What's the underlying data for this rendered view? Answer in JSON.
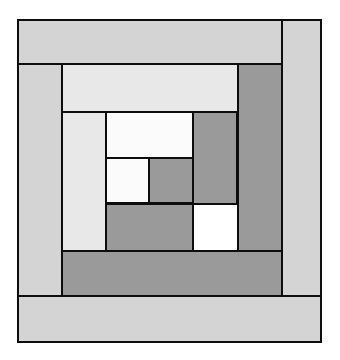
{
  "figure": {
    "type": "quilt-block-diagram",
    "width": 340,
    "height": 360,
    "background": "#ffffff"
  },
  "palette": {
    "outline": "#0d0d0d",
    "outline_width": 2,
    "light_outer": "#d4d4d4",
    "light_inner": "#e8e8e8",
    "light_center": "#fbfbfb",
    "dark": "#9a9a9a",
    "background": "#ffffff"
  },
  "block": {
    "name": "log-cabin-block",
    "bounds": {
      "x": 17,
      "y": 19,
      "width": 305,
      "height": 324
    },
    "center_label": "",
    "ring_count": 3,
    "rotation": "clockwise-spiral"
  },
  "patches": [
    {
      "id": "outer-strip-top",
      "label": "Outer top light log",
      "ring": 1,
      "side": "top",
      "value": "light",
      "color": "#d4d4d4",
      "x": 17,
      "y": 19,
      "width": 266,
      "height": 46
    },
    {
      "id": "outer-strip-right",
      "label": "Outer right light log",
      "ring": 1,
      "side": "right",
      "value": "light",
      "color": "#d4d4d4",
      "x": 281,
      "y": 19,
      "width": 41,
      "height": 324
    },
    {
      "id": "outer-strip-left",
      "label": "Outer left light log",
      "ring": 1,
      "side": "left",
      "value": "light",
      "color": "#d4d4d4",
      "x": 17,
      "y": 63,
      "width": 46,
      "height": 234
    },
    {
      "id": "outer-strip-bottom",
      "label": "Outer bottom light log",
      "ring": 1,
      "side": "bottom",
      "value": "light",
      "color": "#d4d4d4",
      "x": 17,
      "y": 295,
      "width": 305,
      "height": 48
    },
    {
      "id": "ring2-strip-top",
      "label": "Ring 2 top light log",
      "ring": 2,
      "side": "top",
      "value": "light",
      "color": "#e8e8e8",
      "x": 61,
      "y": 63,
      "width": 178,
      "height": 50
    },
    {
      "id": "ring2-strip-right",
      "label": "Ring 2 right dark log",
      "ring": 2,
      "side": "right",
      "value": "dark",
      "color": "#9a9a9a",
      "x": 237,
      "y": 63,
      "width": 46,
      "height": 189
    },
    {
      "id": "ring2-strip-bottom",
      "label": "Ring 2 bottom dark log",
      "ring": 2,
      "side": "bottom",
      "value": "dark",
      "color": "#9a9a9a",
      "x": 61,
      "y": 250,
      "width": 222,
      "height": 47
    },
    {
      "id": "ring3-strip-left",
      "label": "Ring 3 left light log",
      "ring": 3,
      "side": "left",
      "value": "light",
      "color": "#e8e8e8",
      "x": 61,
      "y": 111,
      "width": 46,
      "height": 141
    },
    {
      "id": "ring3-strip-top",
      "label": "Ring 3 top light log",
      "ring": 3,
      "side": "top",
      "value": "light",
      "color": "#fbfbfb",
      "x": 105,
      "y": 111,
      "width": 89,
      "height": 48
    },
    {
      "id": "ring3-strip-right",
      "label": "Ring 3 right dark log",
      "ring": 3,
      "side": "right",
      "value": "dark",
      "color": "#9a9a9a",
      "x": 192,
      "y": 111,
      "width": 46,
      "height": 94
    },
    {
      "id": "ring3-strip-bottom",
      "label": "Ring 3 bottom dark log",
      "ring": 3,
      "side": "bottom",
      "value": "dark",
      "color": "#9a9a9a",
      "x": 105,
      "y": 203,
      "width": 89,
      "height": 49
    },
    {
      "id": "center-square-light",
      "label": "Center light square",
      "ring": 4,
      "side": "center-left",
      "value": "light",
      "color": "#fbfbfb",
      "x": 105,
      "y": 157,
      "width": 45,
      "height": 47
    },
    {
      "id": "center-square-dark",
      "label": "Center dark square",
      "ring": 4,
      "side": "center-right",
      "value": "dark",
      "color": "#9a9a9a",
      "x": 148,
      "y": 157,
      "width": 46,
      "height": 47
    }
  ]
}
